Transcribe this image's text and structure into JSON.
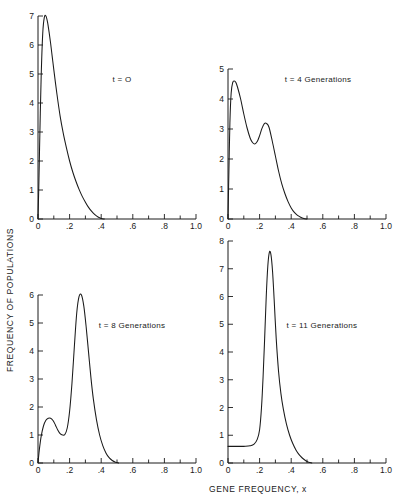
{
  "figure": {
    "xlabel": "GENE FREQUENCY, x",
    "ylabel": "FREQUENCY OF POPULATIONS"
  },
  "chart_data": [
    {
      "type": "line",
      "title": "t = O",
      "xlabel": "GENE FREQUENCY, x",
      "ylabel": "FREQUENCY OF POPULATIONS",
      "xlim": [
        0,
        1.0
      ],
      "ylim": [
        0,
        7
      ],
      "grid": false,
      "xticks": [
        0,
        0.1,
        0.2,
        0.3,
        0.4,
        0.5,
        0.6,
        0.7,
        0.8,
        0.9,
        1.0
      ],
      "xticklabels": [
        "0",
        "",
        ".2",
        "",
        ".4",
        "",
        ".6",
        "",
        ".8",
        "",
        "1.0"
      ],
      "yticks": [
        0,
        1,
        2,
        3,
        4,
        5,
        6,
        7
      ],
      "yticklabels": [
        "0",
        "1",
        "2",
        "3",
        "4",
        "5",
        "6",
        "7"
      ],
      "x": [
        0.0,
        0.005,
        0.012,
        0.02,
        0.03,
        0.04,
        0.05,
        0.06,
        0.07,
        0.08,
        0.09,
        0.1,
        0.12,
        0.14,
        0.16,
        0.18,
        0.2,
        0.22,
        0.24,
        0.26,
        0.28,
        0.3,
        0.32,
        0.34,
        0.36,
        0.38,
        0.4,
        0.42
      ],
      "y": [
        0.0,
        1.1,
        3.0,
        4.9,
        6.4,
        6.95,
        7.0,
        6.8,
        6.45,
        6.05,
        5.6,
        5.15,
        4.3,
        3.55,
        2.95,
        2.45,
        2.0,
        1.62,
        1.3,
        1.02,
        0.78,
        0.58,
        0.4,
        0.26,
        0.15,
        0.07,
        0.02,
        0.0
      ]
    },
    {
      "type": "line",
      "title": "t = 4 Generations",
      "xlabel": "GENE FREQUENCY, x",
      "ylabel": "FREQUENCY OF POPULATIONS",
      "xlim": [
        0,
        1.0
      ],
      "ylim": [
        0,
        5
      ],
      "grid": false,
      "xticks": [
        0,
        0.1,
        0.2,
        0.3,
        0.4,
        0.5,
        0.6,
        0.7,
        0.8,
        0.9,
        1.0
      ],
      "xticklabels": [
        "0",
        "",
        ".2",
        "",
        ".4",
        "",
        ".6",
        "",
        ".8",
        "",
        "1.0"
      ],
      "yticks": [
        0,
        1,
        2,
        3,
        4,
        5
      ],
      "yticklabels": [
        "0",
        "1",
        "2",
        "3",
        "4",
        "5"
      ],
      "x": [
        0.0,
        0.005,
        0.012,
        0.02,
        0.03,
        0.04,
        0.05,
        0.06,
        0.08,
        0.1,
        0.12,
        0.14,
        0.155,
        0.17,
        0.185,
        0.2,
        0.215,
        0.23,
        0.245,
        0.26,
        0.28,
        0.3,
        0.32,
        0.34,
        0.36,
        0.38,
        0.4,
        0.42,
        0.44,
        0.46,
        0.48,
        0.5
      ],
      "y": [
        0.0,
        1.4,
        3.2,
        4.2,
        4.55,
        4.6,
        4.55,
        4.4,
        4.0,
        3.5,
        3.05,
        2.7,
        2.55,
        2.5,
        2.58,
        2.78,
        3.02,
        3.18,
        3.18,
        3.05,
        2.6,
        2.1,
        1.6,
        1.18,
        0.85,
        0.58,
        0.37,
        0.22,
        0.12,
        0.06,
        0.02,
        0.0
      ]
    },
    {
      "type": "line",
      "title": "t = 8 Generations",
      "xlabel": "GENE FREQUENCY, x",
      "ylabel": "FREQUENCY OF POPULATIONS",
      "xlim": [
        0,
        1.0
      ],
      "ylim": [
        0,
        6
      ],
      "grid": false,
      "xticks": [
        0,
        0.1,
        0.2,
        0.3,
        0.4,
        0.5,
        0.6,
        0.7,
        0.8,
        0.9,
        1.0
      ],
      "xticklabels": [
        "0",
        "",
        ".2",
        "",
        ".4",
        "",
        ".6",
        "",
        ".8",
        "",
        "1.0"
      ],
      "yticks": [
        0,
        1,
        2,
        3,
        4,
        5,
        6
      ],
      "yticklabels": [
        "0",
        "1",
        "2",
        "3",
        "4",
        "5",
        "6"
      ],
      "x": [
        0.0,
        0.008,
        0.02,
        0.035,
        0.05,
        0.065,
        0.08,
        0.095,
        0.11,
        0.125,
        0.14,
        0.155,
        0.17,
        0.185,
        0.2,
        0.215,
        0.23,
        0.245,
        0.26,
        0.275,
        0.29,
        0.305,
        0.32,
        0.335,
        0.35,
        0.37,
        0.39,
        0.41,
        0.43,
        0.45,
        0.47,
        0.49,
        0.51
      ],
      "y": [
        0.0,
        0.45,
        0.95,
        1.33,
        1.53,
        1.6,
        1.6,
        1.52,
        1.36,
        1.18,
        1.05,
        1.0,
        1.02,
        1.25,
        1.85,
        2.85,
        4.15,
        5.35,
        5.95,
        6.0,
        5.6,
        4.85,
        3.95,
        3.05,
        2.3,
        1.55,
        1.0,
        0.62,
        0.36,
        0.19,
        0.09,
        0.03,
        0.0
      ]
    },
    {
      "type": "line",
      "title": "t = 11 Generations",
      "xlabel": "GENE FREQUENCY, x",
      "ylabel": "FREQUENCY OF POPULATIONS",
      "xlim": [
        0,
        1.0
      ],
      "ylim": [
        0,
        8
      ],
      "grid": false,
      "xticks": [
        0,
        0.1,
        0.2,
        0.3,
        0.4,
        0.5,
        0.6,
        0.7,
        0.8,
        0.9,
        1.0
      ],
      "xticklabels": [
        "0",
        "",
        ".2",
        "",
        ".4",
        "",
        ".6",
        "",
        ".8",
        "",
        "1.0"
      ],
      "yticks": [
        0,
        1,
        2,
        3,
        4,
        5,
        6,
        7,
        8
      ],
      "yticklabels": [
        "0",
        "1",
        "2",
        "3",
        "4",
        "5",
        "6",
        "7",
        "8"
      ],
      "x": [
        0.0,
        0.02,
        0.05,
        0.08,
        0.11,
        0.14,
        0.165,
        0.185,
        0.2,
        0.212,
        0.222,
        0.232,
        0.242,
        0.252,
        0.262,
        0.272,
        0.282,
        0.292,
        0.305,
        0.32,
        0.335,
        0.35,
        0.37,
        0.39,
        0.41,
        0.43,
        0.45,
        0.47,
        0.49,
        0.51,
        0.53
      ],
      "y": [
        0.6,
        0.6,
        0.6,
        0.6,
        0.6,
        0.62,
        0.68,
        0.85,
        1.2,
        2.0,
        3.1,
        4.5,
        6.0,
        7.1,
        7.6,
        7.5,
        6.9,
        5.9,
        4.5,
        3.3,
        2.5,
        1.95,
        1.4,
        1.0,
        0.7,
        0.47,
        0.3,
        0.18,
        0.09,
        0.03,
        0.0
      ]
    }
  ]
}
